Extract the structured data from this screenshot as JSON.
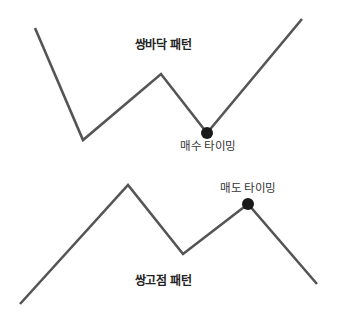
{
  "colors": {
    "background": "#ffffff",
    "line": "#555555",
    "marker": "#1a1a1a",
    "text": "#222222"
  },
  "diagrams": [
    {
      "id": "double-bottom",
      "title": "쌍바닥 패턴",
      "title_pos": [
        163,
        39
      ],
      "points": [
        [
          35,
          28
        ],
        [
          83,
          140
        ],
        [
          161,
          74
        ],
        [
          207,
          133
        ],
        [
          302,
          19
        ]
      ],
      "marker": {
        "point": [
          207,
          133
        ],
        "radius": 6
      },
      "annotation": "매수 타이밍",
      "annotation_pos": [
        208,
        141
      ]
    },
    {
      "id": "double-top",
      "title": "쌍고점 패턴",
      "title_pos": [
        163,
        275
      ],
      "points": [
        [
          20,
          304
        ],
        [
          128,
          185
        ],
        [
          183,
          254
        ],
        [
          248,
          204
        ],
        [
          317,
          284
        ]
      ],
      "marker": {
        "point": [
          248,
          204
        ],
        "radius": 6
      },
      "annotation": "매도 타이밍",
      "annotation_pos": [
        248,
        183
      ]
    }
  ]
}
